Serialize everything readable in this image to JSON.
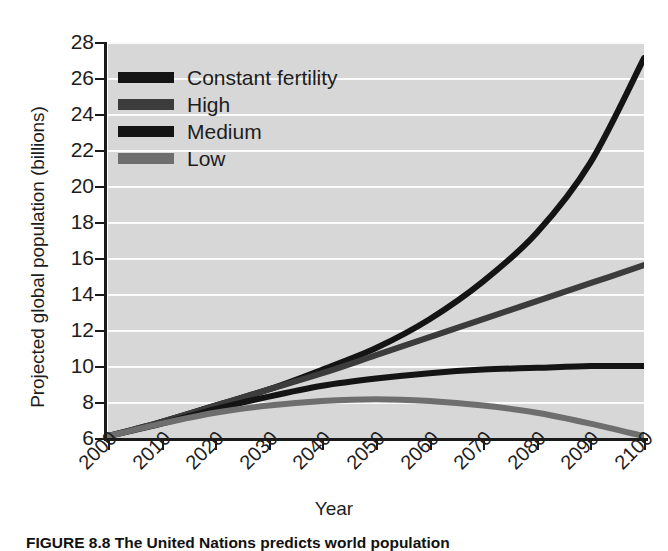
{
  "figure": {
    "caption": "FIGURE 8.8  The United Nations predicts world population"
  },
  "chart_data": {
    "type": "line",
    "title": "",
    "xlabel": "Year",
    "ylabel": "Projected global population (billions)",
    "xlim": [
      2000,
      2100
    ],
    "ylim": [
      6,
      28
    ],
    "grid": "horizontal-white",
    "plot_background": "#d7d7d7",
    "legend_position": "top-left-inside",
    "x": [
      2000,
      2010,
      2020,
      2030,
      2040,
      2050,
      2060,
      2070,
      2080,
      2090,
      2100
    ],
    "xticklabels": [
      "2000",
      "2010",
      "2020",
      "2030",
      "2040",
      "2050",
      "2060",
      "2070",
      "2080",
      "2090",
      "2100"
    ],
    "yticklabels": [
      "6",
      "8",
      "10",
      "12",
      "14",
      "16",
      "18",
      "20",
      "22",
      "24",
      "26",
      "28"
    ],
    "series": [
      {
        "name": "Constant fertility",
        "color": "#141414",
        "values": [
          6.1,
          6.9,
          7.8,
          8.7,
          9.8,
          11.0,
          12.6,
          14.7,
          17.4,
          21.3,
          27.1
        ]
      },
      {
        "name": "High",
        "color": "#3c3c3c",
        "values": [
          6.1,
          6.9,
          7.8,
          8.7,
          9.6,
          10.6,
          11.6,
          12.6,
          13.6,
          14.6,
          15.6
        ]
      },
      {
        "name": "Medium",
        "color": "#141414",
        "values": [
          6.1,
          6.8,
          7.6,
          8.3,
          8.9,
          9.3,
          9.6,
          9.8,
          9.9,
          10.0,
          10.0
        ]
      },
      {
        "name": "Low",
        "color": "#6e6e6e",
        "values": [
          6.1,
          6.8,
          7.4,
          7.8,
          8.05,
          8.15,
          8.05,
          7.8,
          7.4,
          6.8,
          6.1
        ]
      }
    ]
  },
  "axes": {
    "yticks": [
      6,
      8,
      10,
      12,
      14,
      16,
      18,
      20,
      22,
      24,
      26,
      28
    ],
    "xticks": [
      2000,
      2010,
      2020,
      2030,
      2040,
      2050,
      2060,
      2070,
      2080,
      2090,
      2100
    ]
  },
  "legend": {
    "items": [
      {
        "label": "Constant fertility",
        "color": "#141414"
      },
      {
        "label": "High",
        "color": "#3c3c3c"
      },
      {
        "label": "Medium",
        "color": "#141414"
      },
      {
        "label": "Low",
        "color": "#6e6e6e"
      }
    ]
  }
}
